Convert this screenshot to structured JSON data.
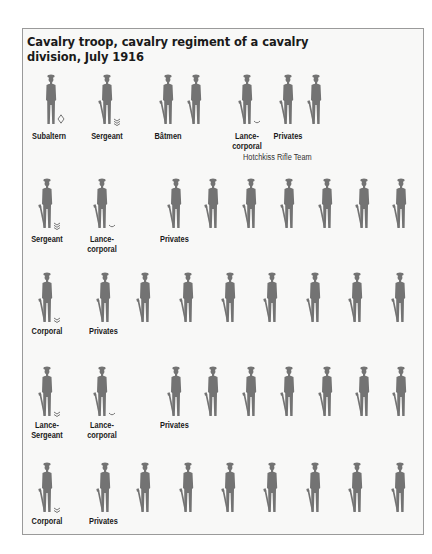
{
  "title": "Cavalry troop, cavalry regiment of a cavalry division, July 1916",
  "colors": {
    "figure": "#737373",
    "frame_bg": "#f8f8f7",
    "frame_border": "#9a9a9a",
    "text": "#1a1a1a"
  },
  "rows": [
    {
      "groups": [
        {
          "label": "Subaltern",
          "rank": "subaltern",
          "insignia": "diamond-icon",
          "figures": [
            51
          ],
          "armed": false
        },
        {
          "label": "Sergeant",
          "rank": "sergeant",
          "insignia": "three-chevron-icon",
          "figures": [
            107
          ],
          "armed": true
        },
        {
          "label": "Bâtmen",
          "rank": "batman",
          "insignia": null,
          "figures": [
            168,
            196
          ],
          "armed": true
        },
        {
          "label": "Lance-\ncorporal",
          "rank": "lance-corporal",
          "insignia": "single-chevron-icon",
          "figures": [
            247
          ],
          "armed": true
        },
        {
          "label": "Privates",
          "rank": "private",
          "insignia": null,
          "figures": [
            288,
            316
          ],
          "armed": true
        }
      ],
      "figure_top": 72,
      "label_top": 131,
      "sublabel": "Hotchkiss Rifle Team"
    },
    {
      "groups": [
        {
          "label": "Sergeant",
          "rank": "sergeant",
          "insignia": "three-chevron-icon",
          "figures": [
            47
          ],
          "armed": true
        },
        {
          "label": "Lance-\ncorporal",
          "rank": "lance-corporal",
          "insignia": "single-chevron-icon",
          "figures": [
            102
          ],
          "armed": true
        },
        {
          "label": "Privates",
          "rank": "private",
          "insignia": null,
          "figures": [
            176,
            213,
            251,
            289,
            327,
            364,
            401
          ],
          "armed": true
        }
      ],
      "figure_top": 176,
      "label_top": 234
    },
    {
      "groups": [
        {
          "label": "Corporal",
          "rank": "corporal",
          "insignia": "two-chevron-icon",
          "figures": [
            47
          ],
          "armed": true
        },
        {
          "label": "Privates",
          "rank": "private",
          "insignia": null,
          "figures": [
            105,
            145,
            188,
            230,
            272,
            315,
            357,
            400
          ],
          "armed": true
        }
      ],
      "figure_top": 270,
      "label_top": 326
    },
    {
      "groups": [
        {
          "label": "Lance-\nSergeant",
          "rank": "lance-sergeant",
          "insignia": "two-chevron-icon",
          "figures": [
            47
          ],
          "armed": true
        },
        {
          "label": "Lance-\ncorporal",
          "rank": "lance-corporal",
          "insignia": "single-chevron-icon",
          "figures": [
            102
          ],
          "armed": true
        },
        {
          "label": "Privates",
          "rank": "private",
          "insignia": null,
          "figures": [
            176,
            213,
            251,
            289,
            327,
            364,
            401
          ],
          "armed": true
        }
      ],
      "figure_top": 364,
      "label_top": 420
    },
    {
      "groups": [
        {
          "label": "Corporal",
          "rank": "corporal",
          "insignia": "two-chevron-icon",
          "figures": [
            47
          ],
          "armed": true
        },
        {
          "label": "Privates",
          "rank": "private",
          "insignia": null,
          "figures": [
            105,
            145,
            188,
            230,
            272,
            315,
            357,
            400
          ],
          "armed": true
        }
      ],
      "figure_top": 460,
      "label_top": 516
    }
  ]
}
